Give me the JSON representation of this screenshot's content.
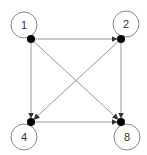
{
  "diagram": {
    "type": "directed-graph",
    "nodes": [
      {
        "id": "1",
        "label": "1",
        "x": 31,
        "y": 39,
        "loop": {
          "cx": 24,
          "cy": 25,
          "r": 13
        }
      },
      {
        "id": "2",
        "label": "2",
        "x": 121,
        "y": 39,
        "loop": {
          "cx": 126,
          "cy": 24,
          "r": 13
        }
      },
      {
        "id": "4",
        "label": "4",
        "x": 31,
        "y": 122,
        "loop": {
          "cx": 24,
          "cy": 137,
          "r": 13
        }
      },
      {
        "id": "8",
        "label": "8",
        "x": 121,
        "y": 122,
        "loop": {
          "cx": 127,
          "cy": 137,
          "r": 13
        }
      }
    ],
    "edges": [
      {
        "from": "1",
        "to": "2"
      },
      {
        "from": "1",
        "to": "4"
      },
      {
        "from": "1",
        "to": "8"
      },
      {
        "from": "2",
        "to": "8"
      },
      {
        "from": "2",
        "to": "4"
      },
      {
        "from": "4",
        "to": "8"
      }
    ],
    "self_loops": [
      "1",
      "2",
      "4",
      "8"
    ],
    "colors": {
      "edge": "#8a8a8a",
      "node": "#000000",
      "loop": "#7a7a7a",
      "label": "#333333"
    }
  }
}
